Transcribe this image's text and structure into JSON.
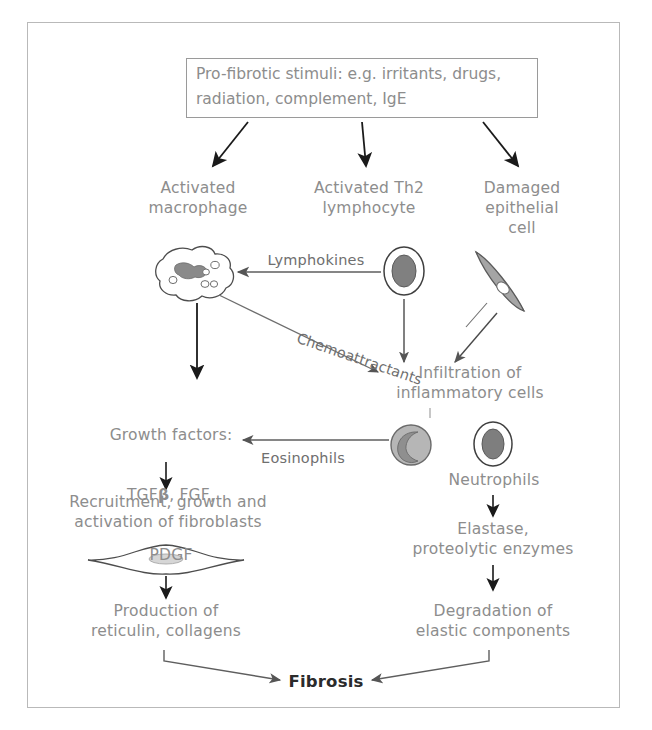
{
  "diagram": {
    "title_box": {
      "text": "Pro-fibrotic stimuli: e.g. irritants, drugs,\nradiation, complement, IgE"
    },
    "nodes": {
      "activated_macrophage": "Activated\nmacrophage",
      "activated_th2": "Activated Th2\nlymphocyte",
      "damaged_epithelial": "Damaged\nepithelial\ncell",
      "infiltration": "Infiltration of\ninflammatory cells",
      "growth_factors_line1": "Growth factors:",
      "growth_factors_line2_a": "TGF",
      "growth_factors_line2_b": "β",
      "growth_factors_line2_c": ", FGF,",
      "growth_factors_line3": "PDGF",
      "neutrophils": "Neutrophils",
      "recruitment": "Recruitment, growth and\nactivation of fibroblasts",
      "elastase": "Elastase,\nproteolytic enzymes",
      "production": "Production of\nreticulin, collagens",
      "degradation": "Degradation of\nelastic components",
      "fibrosis": "Fibrosis"
    },
    "edge_labels": {
      "lymphokines": "Lymphokines",
      "chemoattractants": "Chemoattractants",
      "eosinophils": "Eosinophils"
    },
    "cells": {
      "macrophage": "macrophage-cell-icon",
      "lymphocyte": "lymphocyte-cell-icon",
      "epithelial": "epithelial-cell-icon",
      "eosinophil": "eosinophil-cell-icon",
      "neutrophil": "neutrophil-cell-icon",
      "fibroblast": "fibroblast-cell-icon"
    },
    "colors": {
      "frame_border": "#b9b9b9",
      "box_border": "#9a9a9a",
      "text_gray": "#8d8d8d",
      "text_edge": "#6f6f6f",
      "fibrosis_text": "#2b2b2b",
      "thick_arrow": "#1a1a1a",
      "thin_arrow": "#6e6e6e",
      "cell_fill": "#9d9d9d",
      "cell_stroke": "#5f5f5f"
    }
  }
}
